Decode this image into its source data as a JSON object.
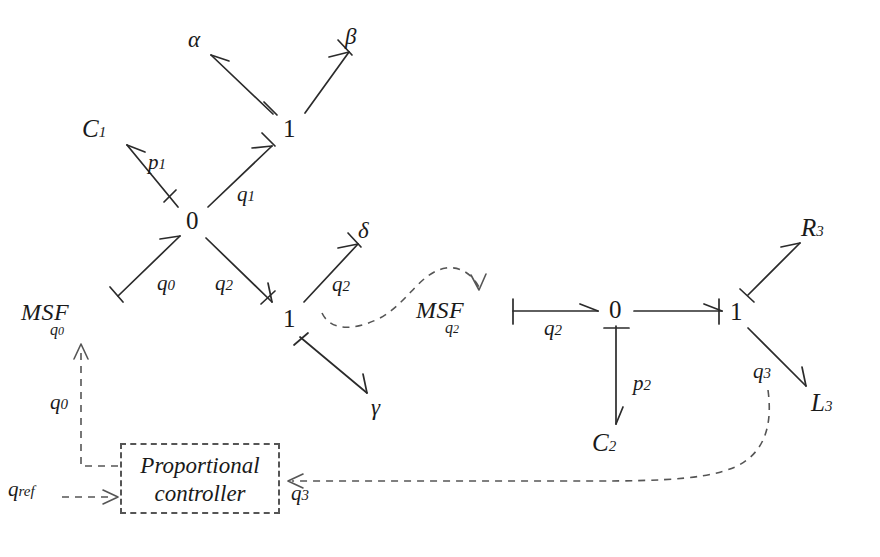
{
  "diagram": {
    "type": "bond-graph",
    "stroke_color": "#2b2b2b",
    "dashed_color": "#555555",
    "background": "#ffffff"
  },
  "nodes": {
    "junction_0_left": {
      "label": "0",
      "x": 193,
      "y": 222
    },
    "junction_1_top": {
      "label": "1",
      "x": 289,
      "y": 130
    },
    "junction_1_mid": {
      "label": "1",
      "x": 289,
      "y": 320
    },
    "junction_0_right": {
      "label": "0",
      "x": 616,
      "y": 311
    },
    "junction_1_right": {
      "label": "1",
      "x": 736,
      "y": 313
    }
  },
  "elements": {
    "c1": {
      "label": "C",
      "sub": "1",
      "x": 94,
      "y": 130
    },
    "c2": {
      "label": "C",
      "sub": "2",
      "x": 603,
      "y": 444
    },
    "r3": {
      "label": "R",
      "sub": "3",
      "x": 812,
      "y": 229
    },
    "l3": {
      "label": "L",
      "sub": "3",
      "x": 822,
      "y": 404
    },
    "msf_q0": {
      "label": "MSF",
      "sub": "q",
      "sub2": "0",
      "x": 57,
      "y": 313
    },
    "msf_q2": {
      "label": "MSF",
      "sub": "q",
      "sub2": "2",
      "x": 450,
      "y": 311
    }
  },
  "greek_ports": {
    "alpha": {
      "label": "α",
      "x": 196,
      "y": 41
    },
    "beta": {
      "label": "β",
      "x": 352,
      "y": 38
    },
    "delta": {
      "label": "δ",
      "x": 365,
      "y": 231
    },
    "gamma": {
      "label": "γ",
      "x": 378,
      "y": 407
    }
  },
  "bond_labels": {
    "p1": {
      "label": "p",
      "sub": "1",
      "x": 155,
      "y": 164
    },
    "q1": {
      "label": "q",
      "sub": "1",
      "x": 244,
      "y": 196
    },
    "q0_left": {
      "label": "q",
      "sub": "0",
      "x": 164,
      "y": 285
    },
    "q2_left": {
      "label": "q",
      "sub": "2",
      "x": 222,
      "y": 285
    },
    "q2_delta": {
      "label": "q",
      "sub": "2",
      "x": 339,
      "y": 286
    },
    "q2_right": {
      "label": "q",
      "sub": "2",
      "x": 551,
      "y": 330
    },
    "p2": {
      "label": "p",
      "sub": "2",
      "x": 640,
      "y": 385
    },
    "q3_right": {
      "label": "q",
      "sub": "3",
      "x": 760,
      "y": 373
    },
    "q0_signal": {
      "label": "q",
      "sub": "0",
      "x": 57,
      "y": 404
    },
    "q3_signal": {
      "label": "q",
      "sub": "3",
      "x": 298,
      "y": 495
    },
    "q_ref": {
      "label": "q",
      "sub": "ref",
      "x": 14,
      "y": 491
    }
  },
  "controller": {
    "box": {
      "x": 120,
      "y": 443,
      "width": 160,
      "height": 71
    },
    "line1": "Proportional",
    "line2": "controller"
  },
  "bonds": [
    {
      "name": "c1-to-0",
      "from": "C1",
      "to": "0-junction",
      "label": "p1",
      "causal_stroke": "at-junction"
    },
    {
      "name": "0-to-1top",
      "from": "0-junction",
      "to": "1-top",
      "label": "q1",
      "causal_stroke": "at-1"
    },
    {
      "name": "1top-to-alpha",
      "from": "1-top",
      "to": "alpha",
      "label": "",
      "causal_stroke": "at-junction"
    },
    {
      "name": "1top-to-beta",
      "from": "1-top",
      "to": "beta",
      "label": "",
      "causal_stroke": "at-beta"
    },
    {
      "name": "msf0-to-0",
      "from": "MSF-q0",
      "to": "0-junction",
      "label": "q0",
      "causal_stroke": "at-msf"
    },
    {
      "name": "0-to-1mid",
      "from": "0-junction",
      "to": "1-mid",
      "label": "q2",
      "causal_stroke": "at-1mid"
    },
    {
      "name": "1mid-to-delta",
      "from": "1-mid",
      "to": "delta",
      "label": "q2",
      "causal_stroke": "at-delta"
    },
    {
      "name": "1mid-to-gamma",
      "from": "1-mid",
      "to": "gamma",
      "label": "",
      "causal_stroke": "at-junction"
    },
    {
      "name": "msf2-to-0right",
      "from": "MSF-q2",
      "to": "0-right",
      "label": "q2",
      "causal_stroke": "at-msf"
    },
    {
      "name": "0right-to-c2",
      "from": "0-right",
      "to": "C2",
      "label": "p2",
      "causal_stroke": "at-junction"
    },
    {
      "name": "0right-to-1right",
      "from": "0-right",
      "to": "1-right",
      "label": "",
      "causal_stroke": "at-1right"
    },
    {
      "name": "1right-to-r3",
      "from": "1-right",
      "to": "R3",
      "label": "",
      "causal_stroke": "at-junction"
    },
    {
      "name": "1right-to-l3",
      "from": "1-right",
      "to": "L3",
      "label": "q3",
      "causal_stroke": "none"
    }
  ],
  "signal_links": [
    {
      "name": "q2-to-msf2",
      "from": "q2-bond",
      "to": "MSF-q2",
      "style": "dashed-curve"
    },
    {
      "name": "q3-to-controller",
      "from": "1-right",
      "to": "controller",
      "style": "dashed-curve"
    },
    {
      "name": "qref-to-controller",
      "from": "q_ref",
      "to": "controller",
      "style": "dashed-line"
    },
    {
      "name": "controller-to-msf0",
      "from": "controller",
      "to": "MSF-q0",
      "style": "dashed-line"
    }
  ]
}
